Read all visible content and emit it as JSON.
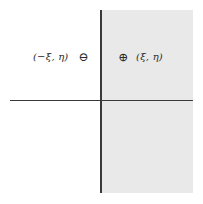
{
  "diagram": {
    "type": "coordinate-plane-reflection",
    "axes": {
      "vertical": {
        "x": 101,
        "y_start": 10,
        "y_end": 193
      },
      "horizontal": {
        "y": 100,
        "x_start": 10,
        "x_end": 193
      },
      "color": "#3a3a3a"
    },
    "shaded_region": {
      "side": "right half-plane",
      "color": "#e9e9e9"
    },
    "points": [
      {
        "id": "left",
        "coordinate_label": "(−ξ, η)",
        "sign_symbol": "⊖",
        "sign_icon": "circled-minus-icon"
      },
      {
        "id": "right",
        "coordinate_label": "(ξ, η)",
        "sign_symbol": "⊕",
        "sign_icon": "circled-plus-icon"
      }
    ]
  }
}
